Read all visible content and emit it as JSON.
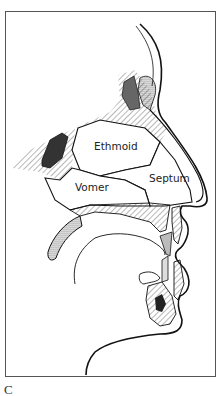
{
  "figure": {
    "panel_label": "C",
    "labels": {
      "ethmoid": "Ethmoid",
      "septum": "Septum",
      "vomer": "Vomer"
    },
    "colors": {
      "ink": "#111111",
      "frame": "#555555",
      "background": "#ffffff"
    }
  }
}
